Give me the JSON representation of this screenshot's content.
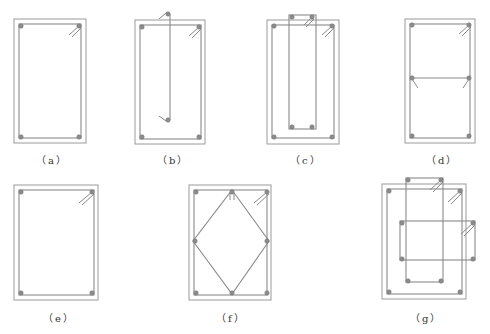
{
  "figure": {
    "panels": [
      {
        "id": "a",
        "label": "（a）",
        "description": "Rectangular section with single closed stirrup and 4 corner bars"
      },
      {
        "id": "b",
        "label": "（b）",
        "description": "Closed stirrup with additional single-leg tie along the middle"
      },
      {
        "id": "c",
        "label": "（c）",
        "description": "Outer closed stirrup with inner narrow closed stirrup"
      },
      {
        "id": "d",
        "label": "（d）",
        "description": "Closed stirrup with horizontal cross-tie at mid-height"
      },
      {
        "id": "e",
        "label": "（e）",
        "description": "Square-ish section with single closed stirrup and 4 corner bars"
      },
      {
        "id": "f",
        "label": "（f）",
        "description": "Outer closed stirrup with inner diamond-shaped stirrup, 8 bars"
      },
      {
        "id": "g",
        "label": "（g）",
        "description": "Outer stirrup with two overlapping inner rectangular stirrups"
      }
    ],
    "colors": {
      "line": "#8a8a8a",
      "bar": "#8c8c8c",
      "background": "#ffffff",
      "caption": "#333333"
    }
  }
}
